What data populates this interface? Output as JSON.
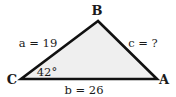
{
  "diagram": {
    "type": "triangle",
    "fill_color": "#efefef",
    "stroke_color": "#111111",
    "vertices": {
      "B": {
        "label": "B"
      },
      "C": {
        "label": "C"
      },
      "A": {
        "label": "A"
      }
    },
    "sides": {
      "a": {
        "label": "a = 19"
      },
      "b": {
        "label": "b = 26"
      },
      "c": {
        "label": "c = ?"
      }
    },
    "angles": {
      "C": {
        "label": "42°"
      }
    }
  }
}
